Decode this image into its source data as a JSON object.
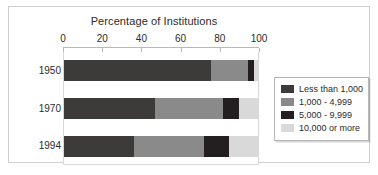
{
  "chart_data": {
    "type": "bar",
    "orientation": "horizontal",
    "stacked": true,
    "title": "Percentage of Institutions",
    "xlabel": "",
    "ylabel": "",
    "xlim": [
      0,
      100
    ],
    "xticks": [
      0,
      20,
      40,
      60,
      80,
      100
    ],
    "xtick_labels": [
      "0",
      "20",
      "40",
      "60",
      "80",
      "100"
    ],
    "grid": false,
    "legend_position": "right",
    "categories": [
      "1950",
      "1970",
      "1994"
    ],
    "series": [
      {
        "name": "Less than 1,000",
        "color": "#3d3a3a",
        "values": [
          76,
          47,
          36
        ]
      },
      {
        "name": "1,000 - 4,999",
        "color": "#8a8a8a",
        "values": [
          19,
          35,
          36
        ]
      },
      {
        "name": "5,000 - 9,999",
        "color": "#231f20",
        "values": [
          3,
          8,
          13
        ]
      },
      {
        "name": "10,000 or more",
        "color": "#d9d9d9",
        "values": [
          2,
          10,
          15
        ]
      }
    ]
  },
  "colors": {
    "frame_border": "#cfcfcf",
    "plot_border": "#d7d7d7",
    "axis_line": "#b9b9b9",
    "text": "#2b2b2b",
    "legend_border": "#b5b5b5",
    "background": "#ffffff"
  }
}
